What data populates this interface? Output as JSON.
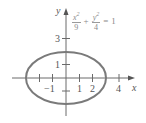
{
  "diagram": {
    "axes": {
      "x_label": "x",
      "y_label": "y",
      "x_ticks": [
        {
          "value": -2,
          "label": ""
        },
        {
          "value": -1,
          "label": "−1"
        },
        {
          "value": 1,
          "label": "1"
        },
        {
          "value": 2,
          "label": "2"
        },
        {
          "value": 4,
          "label": "4"
        }
      ],
      "y_ticks": [
        {
          "value": -1,
          "label": ""
        },
        {
          "value": 1,
          "label": "1"
        },
        {
          "value": 3,
          "label": "3"
        }
      ]
    },
    "equation": {
      "term1_num": "x",
      "term1_exp": "2",
      "term1_den": "9",
      "plus": "+",
      "term2_num": "y",
      "term2_exp": "2",
      "term2_den": "4",
      "equals": "=",
      "rhs": "1"
    },
    "ellipse": {
      "semi_major_x": 3,
      "semi_minor_y": 2,
      "center": [
        0,
        0
      ],
      "stroke_color": "#7a7a7a"
    },
    "colors": {
      "axis": "#6a6a6a",
      "label": "#555555",
      "equation": "#8a8a8a"
    }
  }
}
